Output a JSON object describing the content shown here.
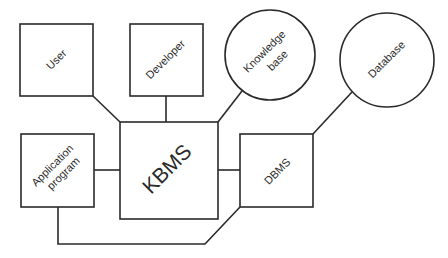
{
  "diagram": {
    "nodes": {
      "user": {
        "label": "User",
        "shape": "square"
      },
      "developer": {
        "label": "Developer",
        "shape": "square"
      },
      "knowledge_base": {
        "line1": "Knowledge",
        "line2": "base",
        "shape": "circle"
      },
      "database": {
        "label": "Database",
        "shape": "circle"
      },
      "application_program": {
        "line1": "Application",
        "line2": "program",
        "shape": "square"
      },
      "kbms": {
        "label": "KBMS",
        "shape": "square"
      },
      "dbms": {
        "label": "DBMS",
        "shape": "square"
      }
    },
    "edges": [
      [
        "user",
        "kbms"
      ],
      [
        "developer",
        "kbms"
      ],
      [
        "knowledge_base",
        "kbms"
      ],
      [
        "application_program",
        "kbms"
      ],
      [
        "kbms",
        "dbms"
      ],
      [
        "database",
        "dbms"
      ],
      [
        "application_program",
        "dbms"
      ]
    ],
    "colors": {
      "stroke": "#2a2a2a",
      "background": "#ffffff"
    }
  }
}
